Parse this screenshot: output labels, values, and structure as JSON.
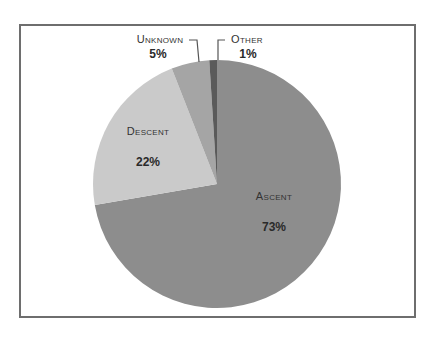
{
  "chart_data": {
    "type": "pie",
    "title": "",
    "slices": [
      {
        "label": "Ascent",
        "value": 73,
        "display": "73%",
        "color": "#8d8d8d"
      },
      {
        "label": "Descent",
        "value": 22,
        "display": "22%",
        "color": "#cacaca"
      },
      {
        "label": "Unknown",
        "value": 5,
        "display": "5%",
        "color": "#a5a5a5"
      },
      {
        "label": "Other",
        "value": 1,
        "display": "1%",
        "color": "#5a5a5a"
      }
    ],
    "legend": "none",
    "labels_position": "inside / callout"
  },
  "labels": {
    "ascent": "Ascent",
    "ascent_pct": "73%",
    "descent": "Descent",
    "descent_pct": "22%",
    "unknown": "Unknown",
    "unknown_pct": "5%",
    "other": "Other",
    "other_pct": "1%"
  }
}
